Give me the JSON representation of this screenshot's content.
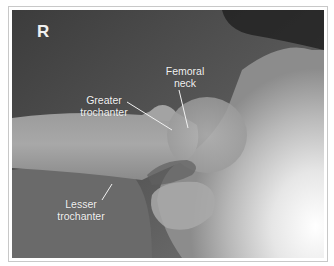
{
  "image": {
    "type": "radiograph",
    "side_marker": "R",
    "labels": [
      {
        "id": "femoral-neck",
        "line1": "Femoral",
        "line2": "neck"
      },
      {
        "id": "greater-trochanter",
        "line1": "Greater",
        "line2": "trochanter"
      },
      {
        "id": "lesser-trochanter",
        "line1": "Lesser",
        "line2": "trochanter"
      }
    ],
    "colors": {
      "dark_tissue": "#3a3a3a",
      "mid_tissue": "#7d7d7d",
      "bone": "#b9b9b9",
      "bright_bone": "#f2f2f2",
      "label_text": "#f2f2f2",
      "frame": "#c8c8c8"
    }
  }
}
